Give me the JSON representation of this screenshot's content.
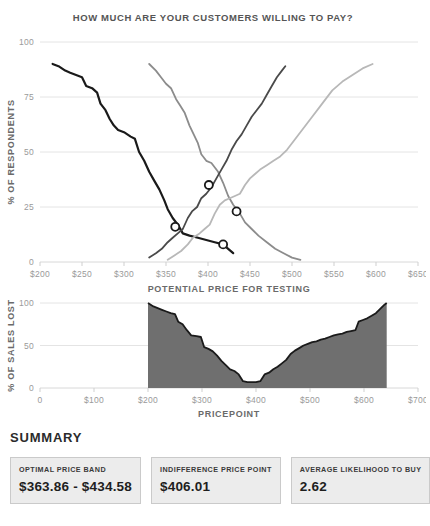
{
  "chart_data": [
    {
      "type": "line",
      "title": "HOW MUCH ARE YOUR CUSTOMERS WILLING TO PAY?",
      "xlabel": "POTENTIAL PRICE FOR TESTING",
      "ylabel": "% OF RESPONDENTS",
      "xlim": [
        200,
        650
      ],
      "ylim": [
        0,
        100
      ],
      "xticks": [
        200,
        250,
        300,
        350,
        400,
        450,
        500,
        550,
        600,
        650
      ],
      "xticklabels": [
        "$200",
        "$250",
        "$300",
        "$350",
        "$400",
        "$450",
        "$500",
        "$550",
        "$600",
        "$650"
      ],
      "yticks": [
        0,
        25,
        50,
        75,
        100
      ],
      "yticklabels": [
        "0",
        "25",
        "50",
        "75",
        "100"
      ],
      "grid": true,
      "legend": "none",
      "series": [
        {
          "name": "too-cheap",
          "color": "#1a1a1a",
          "width": 2.2,
          "points": [
            [
              215,
              90
            ],
            [
              222,
              89
            ],
            [
              230,
              87
            ],
            [
              236,
              86
            ],
            [
              243,
              85
            ],
            [
              250,
              84
            ],
            [
              255,
              80
            ],
            [
              262,
              79
            ],
            [
              268,
              77
            ],
            [
              272,
              72
            ],
            [
              278,
              69
            ],
            [
              283,
              65
            ],
            [
              288,
              62
            ],
            [
              293,
              60
            ],
            [
              300,
              59
            ],
            [
              308,
              57
            ],
            [
              313,
              56
            ],
            [
              318,
              50
            ],
            [
              324,
              46
            ],
            [
              330,
              41
            ],
            [
              336,
              37
            ],
            [
              342,
              33
            ],
            [
              348,
              28
            ],
            [
              352,
              24
            ],
            [
              358,
              20
            ],
            [
              364,
              17
            ],
            [
              370,
              13
            ],
            [
              378,
              12
            ],
            [
              388,
              11
            ],
            [
              398,
              10
            ],
            [
              408,
              9
            ],
            [
              418,
              8
            ],
            [
              424,
              6
            ],
            [
              430,
              4
            ]
          ]
        },
        {
          "name": "cheap",
          "color": "#8c8c8c",
          "width": 1.8,
          "points": [
            [
              330,
              90
            ],
            [
              338,
              87
            ],
            [
              344,
              84
            ],
            [
              350,
              81
            ],
            [
              356,
              79
            ],
            [
              362,
              74
            ],
            [
              367,
              71
            ],
            [
              372,
              68
            ],
            [
              378,
              62
            ],
            [
              383,
              58
            ],
            [
              388,
              54
            ],
            [
              392,
              49
            ],
            [
              398,
              46
            ],
            [
              404,
              45
            ],
            [
              412,
              41
            ],
            [
              418,
              36
            ],
            [
              424,
              30
            ],
            [
              430,
              26
            ],
            [
              438,
              22
            ],
            [
              444,
              18
            ],
            [
              452,
              15
            ],
            [
              460,
              12
            ],
            [
              470,
              9
            ],
            [
              480,
              6
            ],
            [
              490,
              4
            ],
            [
              500,
              2
            ],
            [
              510,
              1
            ]
          ]
        },
        {
          "name": "expensive",
          "color": "#4a4a4a",
          "width": 1.8,
          "points": [
            [
              330,
              2
            ],
            [
              338,
              4
            ],
            [
              345,
              6
            ],
            [
              352,
              9
            ],
            [
              358,
              11
            ],
            [
              364,
              13
            ],
            [
              370,
              15
            ],
            [
              376,
              20
            ],
            [
              381,
              23
            ],
            [
              387,
              25
            ],
            [
              392,
              29
            ],
            [
              398,
              31
            ],
            [
              404,
              34
            ],
            [
              410,
              38
            ],
            [
              416,
              42
            ],
            [
              422,
              46
            ],
            [
              428,
              51
            ],
            [
              434,
              55
            ],
            [
              440,
              58
            ],
            [
              446,
              62
            ],
            [
              452,
              66
            ],
            [
              458,
              69
            ],
            [
              464,
              72
            ],
            [
              470,
              76
            ],
            [
              476,
              80
            ],
            [
              482,
              84
            ],
            [
              488,
              87
            ],
            [
              492,
              89
            ]
          ]
        },
        {
          "name": "too-expensive",
          "color": "#b8b8b8",
          "width": 1.8,
          "points": [
            [
              352,
              1
            ],
            [
              360,
              3
            ],
            [
              368,
              5
            ],
            [
              376,
              8
            ],
            [
              382,
              11
            ],
            [
              390,
              13
            ],
            [
              396,
              15
            ],
            [
              402,
              17
            ],
            [
              408,
              22
            ],
            [
              414,
              26
            ],
            [
              420,
              28
            ],
            [
              426,
              29
            ],
            [
              432,
              30
            ],
            [
              438,
              31
            ],
            [
              444,
              35
            ],
            [
              450,
              38
            ],
            [
              456,
              40
            ],
            [
              462,
              42
            ],
            [
              470,
              44
            ],
            [
              478,
              46
            ],
            [
              486,
              48
            ],
            [
              494,
              51
            ],
            [
              502,
              55
            ],
            [
              512,
              60
            ],
            [
              524,
              66
            ],
            [
              536,
              72
            ],
            [
              548,
              78
            ],
            [
              560,
              82
            ],
            [
              572,
              85
            ],
            [
              584,
              88
            ],
            [
              596,
              90
            ]
          ]
        }
      ],
      "intersections": [
        {
          "name": "point-of-marginal-cheapness",
          "x": 361,
          "y": 16
        },
        {
          "name": "optimal-price-point",
          "x": 401,
          "y": 35
        },
        {
          "name": "indifference-price-point",
          "x": 434,
          "y": 23
        },
        {
          "name": "point-of-marginal-expensiveness",
          "x": 418,
          "y": 8
        }
      ]
    },
    {
      "type": "area",
      "title": "",
      "xlabel": "PRICEPOINT",
      "ylabel": "% OF SALES LOST",
      "xlim": [
        0,
        700
      ],
      "ylim": [
        0,
        100
      ],
      "xticks": [
        0,
        100,
        200,
        300,
        400,
        500,
        600,
        700
      ],
      "xticklabels": [
        "0",
        "$100",
        "$200",
        "$300",
        "$400",
        "$500",
        "$600",
        "$700"
      ],
      "yticks": [
        0,
        50,
        100
      ],
      "yticklabels": [
        "0",
        "50",
        "100"
      ],
      "grid": true,
      "fill_color": "#6f6f6f",
      "line_color": "#1a1a1a",
      "points": [
        [
          200,
          100
        ],
        [
          210,
          96
        ],
        [
          218,
          94
        ],
        [
          226,
          92
        ],
        [
          234,
          90
        ],
        [
          242,
          88
        ],
        [
          250,
          87
        ],
        [
          256,
          78
        ],
        [
          264,
          75
        ],
        [
          272,
          68
        ],
        [
          280,
          62
        ],
        [
          290,
          61
        ],
        [
          298,
          60
        ],
        [
          304,
          48
        ],
        [
          312,
          46
        ],
        [
          320,
          43
        ],
        [
          328,
          38
        ],
        [
          336,
          32
        ],
        [
          344,
          27
        ],
        [
          352,
          22
        ],
        [
          360,
          20
        ],
        [
          368,
          16
        ],
        [
          376,
          8
        ],
        [
          384,
          7
        ],
        [
          392,
          7
        ],
        [
          400,
          7
        ],
        [
          408,
          8
        ],
        [
          416,
          16
        ],
        [
          424,
          18
        ],
        [
          432,
          22
        ],
        [
          440,
          25
        ],
        [
          448,
          29
        ],
        [
          456,
          33
        ],
        [
          464,
          40
        ],
        [
          472,
          44
        ],
        [
          480,
          47
        ],
        [
          488,
          50
        ],
        [
          496,
          52
        ],
        [
          504,
          54
        ],
        [
          512,
          55
        ],
        [
          520,
          57
        ],
        [
          528,
          58
        ],
        [
          536,
          60
        ],
        [
          544,
          62
        ],
        [
          552,
          63
        ],
        [
          560,
          64
        ],
        [
          568,
          66
        ],
        [
          576,
          67
        ],
        [
          584,
          68
        ],
        [
          590,
          78
        ],
        [
          598,
          80
        ],
        [
          606,
          82
        ],
        [
          614,
          85
        ],
        [
          622,
          88
        ],
        [
          630,
          93
        ],
        [
          638,
          98
        ],
        [
          642,
          100
        ]
      ]
    }
  ],
  "header": {
    "title": "HOW MUCH ARE YOUR CUSTOMERS WILLING TO PAY?"
  },
  "chart1": {
    "ylabel": "% OF RESPONDENTS",
    "xlabel": "POTENTIAL PRICE FOR TESTING"
  },
  "chart2": {
    "ylabel": "% OF SALES LOST",
    "xlabel": "PRICEPOINT"
  },
  "summary": {
    "heading": "SUMMARY",
    "cards": [
      {
        "label": "OPTIMAL PRICE BAND",
        "value": "$363.86 - $434.58"
      },
      {
        "label": "INDIFFERENCE PRICE POINT",
        "value": "$406.01"
      },
      {
        "label": "AVERAGE LIKELIHOOD TO BUY",
        "value": "2.62"
      }
    ]
  }
}
